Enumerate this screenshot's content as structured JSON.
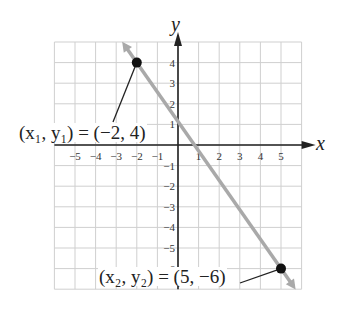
{
  "chart_data": {
    "type": "line",
    "title": "",
    "xlabel": "x",
    "ylabel": "y",
    "xlim": [
      -6,
      6
    ],
    "ylim": [
      -7,
      5
    ],
    "grid": true,
    "x_ticks": [
      "-5",
      "-4",
      "-3",
      "-2",
      "-1",
      "1",
      "2",
      "3",
      "4",
      "5"
    ],
    "y_ticks": [
      "4",
      "3",
      "2",
      "1",
      "-1",
      "-2",
      "-3",
      "-4",
      "-5",
      "-6"
    ],
    "series": [
      {
        "name": "line through points",
        "x": [
          -2,
          5
        ],
        "y": [
          4,
          -6
        ],
        "color": "#a9a9a9"
      }
    ],
    "points": [
      {
        "x": -2,
        "y": 4,
        "label": "(x1, y1) = (-2, 4)"
      },
      {
        "x": 5,
        "y": -6,
        "label": "(x2, y2) = (5, -6)"
      }
    ]
  },
  "labels": {
    "x_axis": "x",
    "y_axis": "y",
    "p1": "(x₁, y₁) = (−2, 4)",
    "p2": "(x₂, y₂) = (5, −6)"
  }
}
